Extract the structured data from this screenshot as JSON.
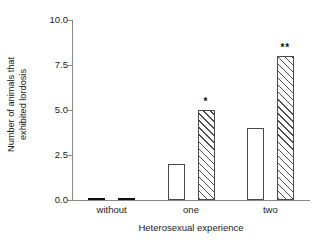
{
  "chart_data": {
    "type": "bar",
    "title": "",
    "xlabel": "Heterosexual experience",
    "ylabel_lines": [
      "Number of animals that",
      "exhibited lordosis"
    ],
    "ylabel": "Number of animals that exhibited lordosis",
    "categories": [
      "without",
      "one",
      "two"
    ],
    "series": [
      {
        "name": "open",
        "fill": "white",
        "values": [
          0,
          2,
          4
        ]
      },
      {
        "name": "hatched",
        "fill": "diagonal-hatch",
        "values": [
          0,
          5,
          8
        ]
      }
    ],
    "annotations": [
      {
        "category": "one",
        "series": "hatched",
        "text": "*"
      },
      {
        "category": "two",
        "series": "hatched",
        "text": "**"
      }
    ],
    "ylim": [
      0.0,
      10.0
    ],
    "yticks": [
      0.0,
      2.5,
      5.0,
      7.5,
      10.0
    ],
    "ytick_labels": [
      "0.0",
      "2.5",
      "5.0",
      "7.5",
      "10.0"
    ],
    "grid": false,
    "legend": "none",
    "axis_color": "#8a8a8a",
    "bar_edge_color": "#4a4a4a",
    "background": "#ffffff"
  }
}
